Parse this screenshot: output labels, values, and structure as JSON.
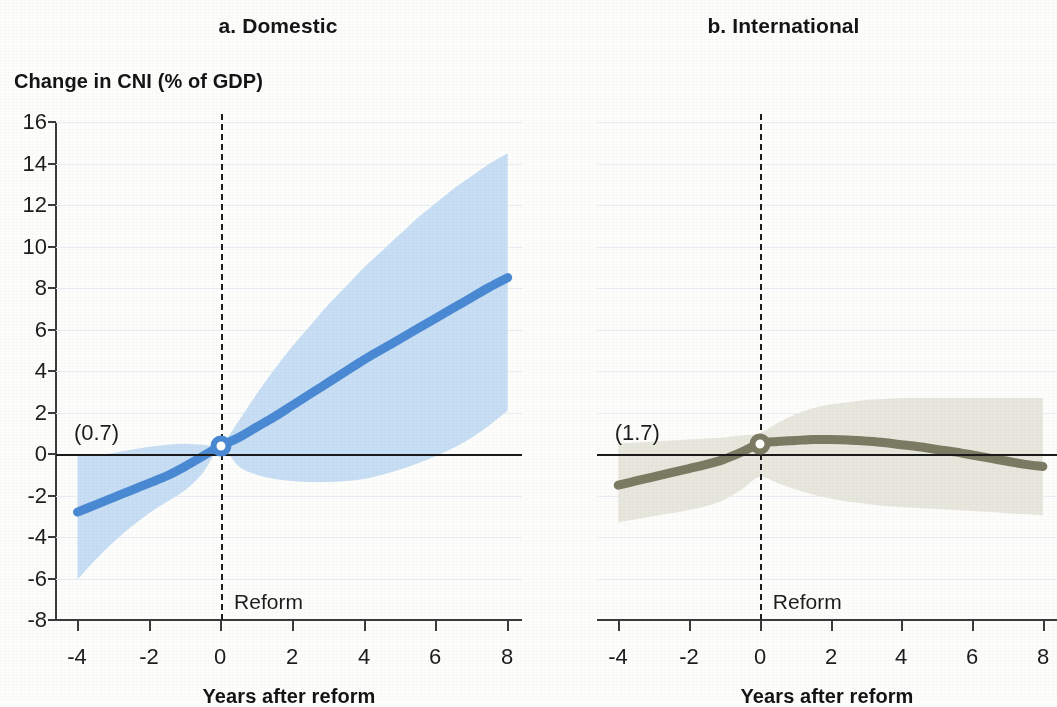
{
  "figure": {
    "yaxis_label": "Change in CNI (% of GDP)",
    "xaxis_label": "Years after reform",
    "reform_label": "Reform"
  },
  "panels": [
    {
      "id": "a",
      "title": "a. Domestic",
      "annotation": "(0.7)",
      "line_color": "#4a8ad4",
      "band_color": "#c4dcf3"
    },
    {
      "id": "b",
      "title": "b. International",
      "annotation": "(1.7)",
      "line_color": "#7b7a63",
      "band_color": "#e6e6dc"
    }
  ],
  "axes": {
    "y_ticks": [
      "16",
      "14",
      "12",
      "10",
      "8",
      "6",
      "4",
      "2",
      "0",
      "-2",
      "-4",
      "-6",
      "-8"
    ],
    "x_ticks": [
      "-4",
      "-2",
      "0",
      "2",
      "4",
      "6",
      "8"
    ]
  },
  "chart_data": [
    {
      "type": "line",
      "title": "a. Domestic",
      "xlabel": "Years after reform",
      "ylabel": "Change in CNI (% of GDP)",
      "xlim": [
        -4.6,
        8.4
      ],
      "ylim": [
        -8,
        16
      ],
      "grid": true,
      "legend": "none",
      "annotations": [
        {
          "text": "(0.7)",
          "x": -4.1,
          "y": 1.0
        },
        {
          "text": "Reform",
          "x": 0.2,
          "y": -7.1
        }
      ],
      "reference_lines": [
        {
          "orientation": "vertical",
          "value": 0,
          "style": "dashed",
          "label": "Reform"
        },
        {
          "orientation": "horizontal",
          "value": 0,
          "style": "solid"
        }
      ],
      "marker_points": [
        {
          "x": 0,
          "y": 0.4
        }
      ],
      "x": [
        -4,
        -3.5,
        -3,
        -2.5,
        -2,
        -1.5,
        -1,
        -0.5,
        0,
        0.5,
        1,
        1.5,
        2,
        2.5,
        3,
        3.5,
        4,
        4.5,
        5,
        5.5,
        6,
        6.5,
        7,
        7.5,
        8
      ],
      "series": [
        {
          "name": "Point estimate",
          "values": [
            -2.8,
            -2.45,
            -2.1,
            -1.75,
            -1.4,
            -1.05,
            -0.6,
            -0.1,
            0.4,
            0.8,
            1.3,
            1.8,
            2.35,
            2.9,
            3.45,
            4.0,
            4.55,
            5.05,
            5.55,
            6.05,
            6.55,
            7.05,
            7.55,
            8.05,
            8.5
          ]
        },
        {
          "name": "Confidence interval upper",
          "values": [
            -0.1,
            -0.05,
            0.05,
            0.2,
            0.35,
            0.45,
            0.5,
            0.45,
            0.45,
            1.6,
            2.9,
            4.1,
            5.2,
            6.2,
            7.2,
            8.1,
            9.0,
            9.8,
            10.6,
            11.4,
            12.1,
            12.8,
            13.4,
            14.0,
            14.5
          ]
        },
        {
          "name": "Confidence interval lower",
          "values": [
            -6.05,
            -5.1,
            -4.25,
            -3.5,
            -2.85,
            -2.3,
            -1.75,
            -0.9,
            0.3,
            -0.6,
            -1.0,
            -1.2,
            -1.3,
            -1.35,
            -1.35,
            -1.3,
            -1.2,
            -1.0,
            -0.75,
            -0.45,
            -0.1,
            0.3,
            0.8,
            1.4,
            2.1
          ]
        }
      ]
    },
    {
      "type": "line",
      "title": "b. International",
      "xlabel": "Years after reform",
      "ylabel": "Change in CNI (% of GDP)",
      "xlim": [
        -4.6,
        8.4
      ],
      "ylim": [
        -8,
        16
      ],
      "grid": true,
      "legend": "none",
      "annotations": [
        {
          "text": "(1.7)",
          "x": -4.1,
          "y": 1.0
        },
        {
          "text": "Reform",
          "x": 0.2,
          "y": -7.1
        }
      ],
      "reference_lines": [
        {
          "orientation": "vertical",
          "value": 0,
          "style": "dashed",
          "label": "Reform"
        },
        {
          "orientation": "horizontal",
          "value": 0,
          "style": "solid"
        }
      ],
      "marker_points": [
        {
          "x": 0,
          "y": 0.5
        }
      ],
      "x": [
        -4,
        -3.5,
        -3,
        -2.5,
        -2,
        -1.5,
        -1,
        -0.5,
        0,
        0.5,
        1,
        1.5,
        2,
        2.5,
        3,
        3.5,
        4,
        4.5,
        5,
        5.5,
        6,
        6.5,
        7,
        7.5,
        8
      ],
      "series": [
        {
          "name": "Point estimate",
          "values": [
            -1.5,
            -1.3,
            -1.1,
            -0.9,
            -0.7,
            -0.5,
            -0.25,
            0.1,
            0.5,
            0.6,
            0.65,
            0.7,
            0.7,
            0.68,
            0.62,
            0.55,
            0.45,
            0.35,
            0.22,
            0.1,
            -0.05,
            -0.2,
            -0.35,
            -0.5,
            -0.6
          ]
        },
        {
          "name": "Confidence interval upper",
          "values": [
            0.5,
            0.55,
            0.6,
            0.65,
            0.7,
            0.75,
            0.8,
            0.9,
            1.0,
            1.5,
            1.9,
            2.2,
            2.4,
            2.5,
            2.6,
            2.65,
            2.7,
            2.7,
            2.7,
            2.7,
            2.7,
            2.7,
            2.7,
            2.7,
            2.7
          ]
        },
        {
          "name": "Confidence interval lower",
          "values": [
            -3.3,
            -3.15,
            -3.0,
            -2.85,
            -2.7,
            -2.5,
            -2.2,
            -1.7,
            -1.1,
            -1.4,
            -1.7,
            -1.95,
            -2.15,
            -2.3,
            -2.4,
            -2.5,
            -2.55,
            -2.6,
            -2.65,
            -2.7,
            -2.75,
            -2.8,
            -2.85,
            -2.9,
            -2.95
          ]
        }
      ]
    }
  ]
}
